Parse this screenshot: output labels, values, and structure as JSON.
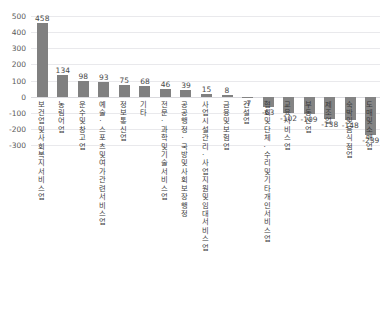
{
  "title_strip": {
    "left": "",
    "middle": "",
    "right": ""
  },
  "axis": {
    "yticks": [
      "500",
      "400",
      "300",
      "200",
      "100",
      "0",
      "-100",
      "-200",
      "-300"
    ],
    "ymax": 500,
    "ymin": -300
  },
  "chart_data": {
    "type": "bar",
    "title": "",
    "xlabel": "",
    "ylabel": "",
    "ylim": [
      -300,
      500
    ],
    "ytick_step": 100,
    "grid": true,
    "legend": "none",
    "bar_color": "#808080",
    "categories": [
      "보건업 및 사회복지서비스업",
      "농림어업",
      "운수 및 창고업",
      "예술·스포츠 및 여가관련 서비스업",
      "정보통신업",
      "기타",
      "전문·과학 및 기술서비스업",
      "공공행정·국방 및 사회보장 행정",
      "사업시설관리·사업지원 및 임대서비스업",
      "금융 및 보험업",
      "건설업",
      "협회 및 단체·수리 및 기타 개인서비스업",
      "교육서비스업",
      "부동산업",
      "제조업",
      "숙박 및 음식점업",
      "도매 및 소매업"
    ],
    "values": [
      458,
      134,
      98,
      93,
      75,
      68,
      46,
      39,
      15,
      8,
      -7,
      -63,
      -102,
      -109,
      -138,
      -148,
      -239
    ],
    "value_labels": [
      "458",
      "134",
      "98",
      "93",
      "75",
      "68",
      "46",
      "39",
      "15",
      "8",
      "-7",
      "-63",
      "-102",
      "-109",
      "-138",
      "-148",
      "-239"
    ]
  }
}
